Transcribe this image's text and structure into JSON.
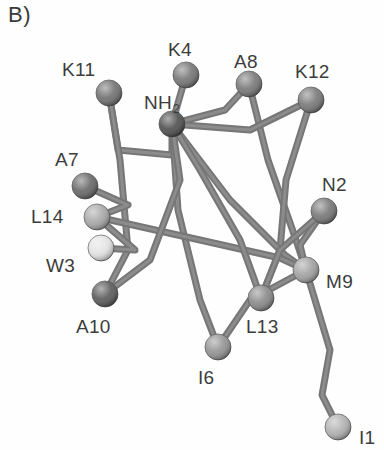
{
  "figure": {
    "panel_letter": "B)",
    "type": "molecular-structure",
    "background_color": "#fefefe",
    "label_color": "#3c3c3c",
    "bond_color": "#767676",
    "bond_color_dark": "#5e5e5e",
    "bond_width": 7
  },
  "chart_data": {
    "type": "scatter",
    "title": "B)",
    "xlabel": "",
    "ylabel": "",
    "xlim": [
      0,
      384
    ],
    "ylim": [
      0,
      450
    ],
    "grid": false,
    "legend": false,
    "nodes": [
      {
        "id": "K11",
        "label": "K11",
        "x": 109,
        "y": 93,
        "r": 13,
        "shade": "#6e6e6e",
        "label_x": 62,
        "label_y": 60
      },
      {
        "id": "K4",
        "label": "K4",
        "x": 186,
        "y": 75,
        "r": 13,
        "shade": "#737373",
        "label_x": 168,
        "label_y": 40
      },
      {
        "id": "A8",
        "label": "A8",
        "x": 249,
        "y": 84,
        "r": 13,
        "shade": "#757575",
        "label_x": 234,
        "label_y": 52
      },
      {
        "id": "K12",
        "label": "K12",
        "x": 311,
        "y": 100,
        "r": 13,
        "shade": "#767676",
        "label_x": 295,
        "label_y": 62
      },
      {
        "id": "NH2",
        "label": "NH2",
        "x": 172,
        "y": 124,
        "r": 13,
        "shade": "#4c4c4c",
        "label_x": 144,
        "label_y": 93
      },
      {
        "id": "A7",
        "label": "A7",
        "x": 85,
        "y": 186,
        "r": 13,
        "shade": "#656565",
        "label_x": 55,
        "label_y": 150
      },
      {
        "id": "N2",
        "label": "N2",
        "x": 324,
        "y": 211,
        "r": 13,
        "shade": "#757575",
        "label_x": 322,
        "label_y": 175
      },
      {
        "id": "L14",
        "label": "L14",
        "x": 97,
        "y": 217,
        "r": 13,
        "shade": "#a6a6a6",
        "label_x": 31,
        "label_y": 207
      },
      {
        "id": "W3",
        "label": "W3",
        "x": 101,
        "y": 248,
        "r": 13,
        "shade": "#e2e2e2",
        "label_x": 46,
        "label_y": 256
      },
      {
        "id": "M9",
        "label": "M9",
        "x": 306,
        "y": 270,
        "r": 13,
        "shade": "#a0a0a0",
        "label_x": 326,
        "label_y": 272
      },
      {
        "id": "A10",
        "label": "A10",
        "x": 105,
        "y": 294,
        "r": 13,
        "shade": "#575757",
        "label_x": 76,
        "label_y": 317
      },
      {
        "id": "L13",
        "label": "L13",
        "x": 261,
        "y": 298,
        "r": 13,
        "shade": "#878787",
        "label_x": 246,
        "label_y": 317
      },
      {
        "id": "I6",
        "label": "I6",
        "x": 218,
        "y": 347,
        "r": 13,
        "shade": "#919191",
        "label_x": 198,
        "label_y": 368
      },
      {
        "id": "I1",
        "label": "I1",
        "x": 338,
        "y": 427,
        "r": 13,
        "shade": "#b0b0b0",
        "label_x": 359,
        "label_y": 428
      }
    ],
    "bonds": [
      {
        "from": "K11",
        "to": "NH2",
        "via": [
          [
            118,
            150
          ],
          [
            172,
            155
          ]
        ]
      },
      {
        "from": "K11",
        "to": "A10",
        "via": [
          [
            120,
            160
          ],
          [
            128,
            250
          ]
        ]
      },
      {
        "from": "K4",
        "to": "NH2",
        "via": []
      },
      {
        "from": "NH2",
        "to": "A8",
        "via": [
          [
            225,
            110
          ]
        ]
      },
      {
        "from": "A8",
        "to": "M9",
        "via": [
          [
            268,
            160
          ],
          [
            296,
            240
          ]
        ]
      },
      {
        "from": "K12",
        "to": "NH2",
        "via": [
          [
            250,
            130
          ]
        ]
      },
      {
        "from": "K12",
        "to": "L13",
        "via": [
          [
            286,
            180
          ],
          [
            280,
            250
          ]
        ]
      },
      {
        "from": "NH2",
        "to": "M9",
        "via": [
          [
            230,
            200
          ],
          [
            285,
            255
          ]
        ]
      },
      {
        "from": "NH2",
        "to": "I6",
        "via": [
          [
            178,
            210
          ],
          [
            200,
            300
          ]
        ]
      },
      {
        "from": "A7",
        "to": "L14",
        "via": [
          [
            128,
            205
          ]
        ]
      },
      {
        "from": "L14",
        "to": "M9",
        "via": [
          [
            200,
            240
          ],
          [
            280,
            258
          ]
        ]
      },
      {
        "from": "W3",
        "to": "L14",
        "via": [
          [
            135,
            250
          ]
        ]
      },
      {
        "from": "A10",
        "to": "NH2",
        "via": [
          [
            150,
            260
          ],
          [
            180,
            180
          ]
        ]
      },
      {
        "from": "N2",
        "to": "M9",
        "via": [
          [
            300,
            245
          ]
        ]
      },
      {
        "from": "N2",
        "to": "L13",
        "via": [
          [
            280,
            250
          ]
        ]
      },
      {
        "from": "M9",
        "to": "I1",
        "via": [
          [
            330,
            350
          ],
          [
            322,
            395
          ]
        ]
      },
      {
        "from": "L13",
        "to": "NH2",
        "via": [
          [
            240,
            240
          ],
          [
            200,
            170
          ]
        ]
      },
      {
        "from": "I6",
        "to": "M9",
        "via": [
          [
            250,
            300
          ]
        ]
      }
    ]
  }
}
